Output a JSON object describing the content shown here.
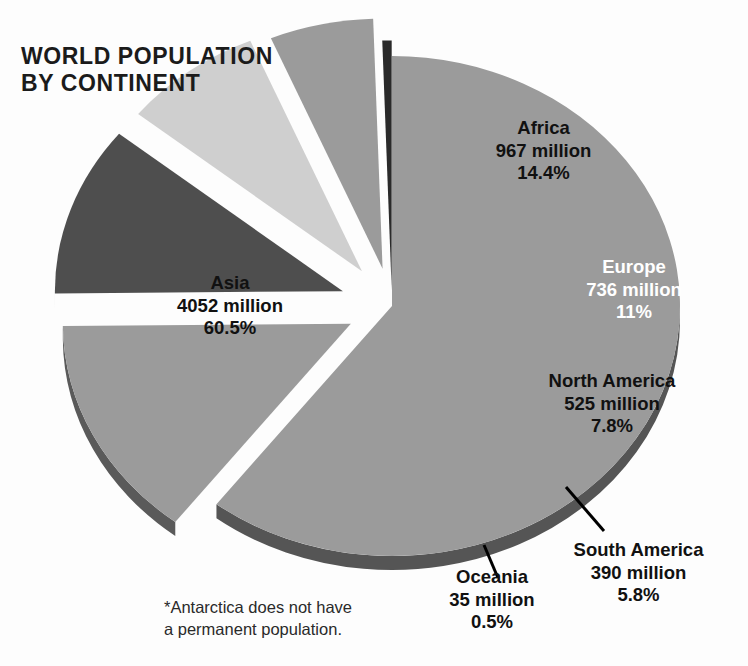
{
  "title": "WORLD POPULATION\nBY CONTINENT",
  "footnote": "*Antarctica does not have\na permanent population.",
  "labels": {
    "asia": {
      "name": "Asia",
      "population": "4052 million",
      "percent": "60.5%"
    },
    "africa": {
      "name": "Africa",
      "population": "967 million",
      "percent": "14.4%"
    },
    "europe": {
      "name": "Europe",
      "population": "736 million",
      "percent": "11%"
    },
    "north_america": {
      "name": "North America",
      "population": "525 million",
      "percent": "7.8%"
    },
    "south_america": {
      "name": "South America",
      "population": "390 million",
      "percent": "5.8%"
    },
    "oceania": {
      "name": "Oceania",
      "population": "35 million",
      "percent": "0.5%"
    }
  },
  "colors": {
    "background": "#fdfdfd",
    "asia_top": "#9b9b9b",
    "asia_side": "#555555",
    "africa_top": "#9b9b9b",
    "africa_side": "#5a5a5a",
    "europe_top": "#4e4e4e",
    "europe_side": "#232323",
    "north_america_top": "#cfcfcf",
    "north_america_side": "#8e8e8e",
    "south_america_top": "#9b9b9b",
    "south_america_side": "#5a5a5a",
    "oceania_top": "#2a2a2a",
    "oceania_side": "#101010",
    "text": "#111111",
    "leader_line": "#000000"
  },
  "chart_data": {
    "type": "pie",
    "title": "WORLD POPULATION BY CONTINENT",
    "subtitle": "",
    "xlabel": "",
    "ylabel": "",
    "unit": "million people",
    "note": "*Antarctica does not have a permanent population.",
    "legend_position": "none (labels on slices)",
    "grid": false,
    "exploded": true,
    "three_d": true,
    "total_population_million": 6705,
    "categories": [
      "Asia",
      "Africa",
      "Europe",
      "North America",
      "South America",
      "Oceania"
    ],
    "values": [
      4052,
      967,
      736,
      525,
      390,
      35
    ],
    "percentages": [
      60.5,
      14.4,
      11,
      7.8,
      5.8,
      0.5
    ],
    "slices": [
      {
        "label": "Asia",
        "value": 4052,
        "percent": 60.5,
        "value_text": "4052 million",
        "percent_text": "60.5%",
        "color": "#9b9b9b",
        "exploded": false
      },
      {
        "label": "Africa",
        "value": 967,
        "percent": 14.4,
        "value_text": "967 million",
        "percent_text": "14.4%",
        "color": "#9b9b9b",
        "exploded": true
      },
      {
        "label": "Europe",
        "value": 736,
        "percent": 11.0,
        "value_text": "736 million",
        "percent_text": "11%",
        "color": "#4e4e4e",
        "exploded": true
      },
      {
        "label": "North America",
        "value": 525,
        "percent": 7.8,
        "value_text": "525 million",
        "percent_text": "7.8%",
        "color": "#cfcfcf",
        "exploded": true
      },
      {
        "label": "South America",
        "value": 390,
        "percent": 5.8,
        "value_text": "390 million",
        "percent_text": "5.8%",
        "color": "#9b9b9b",
        "exploded": true
      },
      {
        "label": "Oceania",
        "value": 35,
        "percent": 0.5,
        "value_text": "35 million",
        "percent_text": "0.5%",
        "color": "#2a2a2a",
        "exploded": true
      }
    ]
  }
}
